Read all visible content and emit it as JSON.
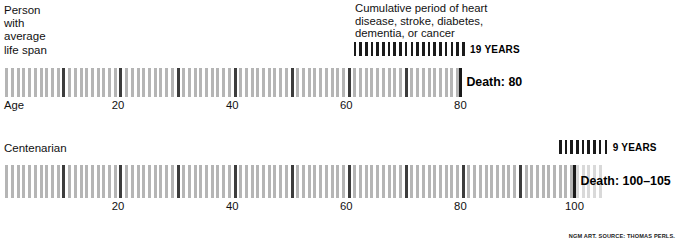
{
  "chart_data": {
    "type": "bar",
    "title": "",
    "xlabel": "Age",
    "ylabel": "",
    "grid": false,
    "legend_position": "inline-annotation",
    "axis": {
      "units": "years",
      "tick_interval_years": 1,
      "major_tick_interval_years": 10
    },
    "series": [
      {
        "name": "Person with average life span",
        "label": "Person\nwith\naverage\nlife span",
        "start_age": 0,
        "end_age": 80,
        "death_label": "Death: 80",
        "axis_origin_label": "Age",
        "axis_ticks": [
          20,
          40,
          60,
          80
        ],
        "axis_max": 80,
        "disease_years": 19,
        "disease_label": "19 YEARS",
        "disease_start_age": 61,
        "disease_end_age": 80,
        "uncertain_from_age": null
      },
      {
        "name": "Centenarian",
        "label": "Centenarian",
        "start_age": 0,
        "end_age": 105,
        "death_label": "Death: 100–105",
        "axis_origin_label": "",
        "axis_ticks": [
          20,
          40,
          60,
          80,
          100
        ],
        "axis_max": 105,
        "disease_years": 9,
        "disease_label": "9 YEARS",
        "disease_start_age": 97,
        "disease_end_age": 105,
        "uncertain_from_age": 100
      }
    ]
  },
  "annotation": {
    "disease_note": "Cumulative period of heart\ndisease, stroke, diabetes,\ndementia, or cancer"
  },
  "credit": {
    "text": "NGM ART. SOURCE: THOMAS PERLS."
  },
  "colors": {
    "tick_light": "#b5b5b5",
    "tick_major": "#3d3d3d",
    "tick_dark": "#1a1a1a",
    "tick_faded": "#d9d9d9",
    "text": "#111111",
    "background": "#ffffff"
  }
}
